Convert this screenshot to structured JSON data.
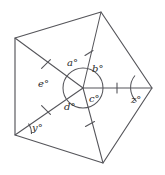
{
  "figure": {
    "stroke_color": "#55555a",
    "background_color": "#ffffff",
    "center": {
      "x": 83,
      "y": 88
    },
    "circle_radius": 20,
    "vertices": [
      {
        "name": "top-left",
        "x": 15,
        "y": 38
      },
      {
        "name": "top",
        "x": 101,
        "y": 12
      },
      {
        "name": "right",
        "x": 152,
        "y": 88
      },
      {
        "name": "bottom",
        "x": 103,
        "y": 163
      },
      {
        "name": "bottom-left",
        "x": 15,
        "y": 135
      }
    ],
    "tick_marks": [
      {
        "spoke": "to-top-left",
        "x": 46,
        "y": 64
      },
      {
        "spoke": "to-top",
        "x": 89,
        "y": 53
      },
      {
        "spoke": "to-right",
        "x": 117,
        "y": 88
      },
      {
        "spoke": "to-bottom",
        "x": 90,
        "y": 124
      },
      {
        "spoke": "to-bottom-left",
        "x": 46,
        "y": 110
      }
    ]
  },
  "labels": {
    "center_angles": [
      {
        "id": "a",
        "text": "a°",
        "x": 67,
        "y": 58
      },
      {
        "id": "b",
        "text": "b°",
        "x": 92,
        "y": 64
      },
      {
        "id": "c",
        "text": "c°",
        "x": 89,
        "y": 94
      },
      {
        "id": "d",
        "text": "d°",
        "x": 64,
        "y": 102
      },
      {
        "id": "e",
        "text": "e°",
        "x": 38,
        "y": 79
      }
    ],
    "vertex_angles": [
      {
        "id": "y",
        "text": "y°",
        "x": 32,
        "y": 123
      },
      {
        "id": "z",
        "text": "z°",
        "x": 131,
        "y": 95
      }
    ]
  }
}
